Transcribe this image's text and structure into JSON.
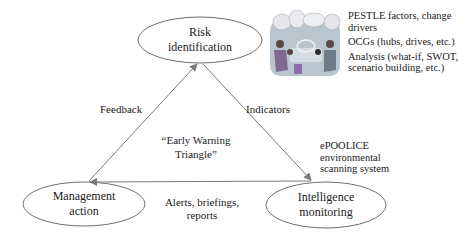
{
  "diagram": {
    "title": "Early Warning Triangle",
    "center_label": "“Early Warning Triangle”",
    "center_label_lines": [
      "“Early Warning",
      "Triangle”"
    ],
    "nodes": [
      {
        "id": "risk",
        "lines": [
          "Risk",
          "identification"
        ]
      },
      {
        "id": "management",
        "lines": [
          "Management",
          "action"
        ]
      },
      {
        "id": "intelligence",
        "lines": [
          "Intelligence",
          "monitoring"
        ]
      }
    ],
    "edges": [
      {
        "from": "management",
        "to": "risk",
        "label": "Feedback"
      },
      {
        "from": "risk",
        "to": "intelligence",
        "label": "Indicators"
      },
      {
        "from": "intelligence",
        "to": "management",
        "label_lines": [
          "Alerts, briefings,",
          "reports"
        ]
      }
    ],
    "system_label_lines": [
      "ePOOLICE",
      "environmental",
      "scanning system"
    ],
    "notes": [
      "PESTLE factors, change drivers",
      "OCGs (hubs, drives, etc.)",
      "Analysis (what-if, SWOT, scenario building, etc.)"
    ],
    "illustration": "team-meeting-illustration"
  },
  "colors": {
    "line": "#7a7a7a",
    "text": "#1a1a1a",
    "illustration_bg": "#b8c4cc",
    "illustration_accent": "#8a6fa8"
  }
}
